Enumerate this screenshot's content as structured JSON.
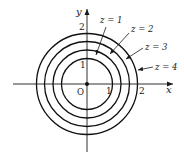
{
  "figure": {
    "axes": {
      "x_label": "x",
      "y_label": "y",
      "origin_label": "O",
      "x_ticks": [
        "1",
        "2"
      ],
      "y_ticks": [
        "1",
        "2"
      ]
    },
    "contours": [
      {
        "label": "z = 1",
        "level": 1
      },
      {
        "label": "z = 2",
        "level": 2
      },
      {
        "label": "z = 3",
        "level": 3
      },
      {
        "label": "z = 4",
        "level": 4
      }
    ],
    "colors": {
      "ink": "#111111",
      "background": "#ffffff"
    }
  }
}
